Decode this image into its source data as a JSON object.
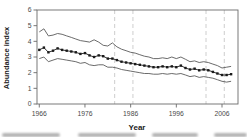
{
  "figure": {
    "xlabel": "Year",
    "ylabel": "Abundance index"
  },
  "chart_data": {
    "type": "line",
    "title": "",
    "xlabel": "Year",
    "ylabel": "Abundance index",
    "xlim": [
      1965.5,
      2009.5
    ],
    "ylim": [
      0,
      6
    ],
    "x_ticks": [
      1966,
      1976,
      1986,
      1996,
      2006
    ],
    "y_ticks": [
      0,
      1,
      2,
      3,
      4,
      5,
      6
    ],
    "grid": "off",
    "legend": "none",
    "reference_lines_x": [
      1982.5,
      1986.5,
      2002.5,
      2006.5
    ],
    "reference_line_color": "#c2c2c2",
    "axis_color": "#6a6a6a",
    "x": [
      1966,
      1967,
      1968,
      1969,
      1970,
      1971,
      1972,
      1973,
      1974,
      1975,
      1976,
      1977,
      1978,
      1979,
      1980,
      1981,
      1982,
      1983,
      1984,
      1985,
      1986,
      1987,
      1988,
      1989,
      1990,
      1991,
      1992,
      1993,
      1994,
      1995,
      1996,
      1997,
      1998,
      1999,
      2000,
      2001,
      2002,
      2003,
      2004,
      2005,
      2006,
      2007,
      2008
    ],
    "series": [
      {
        "name": "abundance-index",
        "style": "line-with-square-markers",
        "color": "#1a1a1a",
        "values": [
          3.45,
          3.6,
          3.3,
          3.4,
          3.55,
          3.45,
          3.4,
          3.35,
          3.3,
          3.2,
          3.25,
          3.1,
          3.0,
          3.1,
          3.05,
          2.9,
          2.9,
          2.8,
          2.7,
          2.65,
          2.6,
          2.55,
          2.5,
          2.45,
          2.4,
          2.35,
          2.35,
          2.4,
          2.35,
          2.4,
          2.35,
          2.45,
          2.3,
          2.2,
          2.25,
          2.15,
          2.2,
          2.15,
          2.05,
          1.95,
          1.85,
          1.85,
          1.9
        ]
      },
      {
        "name": "upper-confidence-limit",
        "style": "line",
        "color": "#5a5a5a",
        "values": [
          4.6,
          4.8,
          4.35,
          4.4,
          4.5,
          4.45,
          4.35,
          4.25,
          4.15,
          4.05,
          4.0,
          3.95,
          4.1,
          3.95,
          3.75,
          3.7,
          3.9,
          3.65,
          3.5,
          3.4,
          3.3,
          3.25,
          3.15,
          3.05,
          3.0,
          2.9,
          2.9,
          2.95,
          2.9,
          3.0,
          2.9,
          3.0,
          2.85,
          2.7,
          2.75,
          2.65,
          2.7,
          2.65,
          2.55,
          2.45,
          2.3,
          2.35,
          2.4
        ]
      },
      {
        "name": "lower-confidence-limit",
        "style": "line",
        "color": "#5a5a5a",
        "values": [
          2.9,
          3.0,
          2.7,
          2.8,
          2.9,
          2.85,
          2.8,
          2.75,
          2.7,
          2.6,
          2.65,
          2.5,
          2.45,
          2.5,
          2.5,
          2.35,
          2.35,
          2.3,
          2.2,
          2.15,
          2.1,
          2.05,
          2.0,
          1.95,
          1.95,
          1.9,
          1.9,
          1.95,
          1.9,
          1.95,
          1.9,
          1.95,
          1.85,
          1.75,
          1.8,
          1.7,
          1.75,
          1.7,
          1.65,
          1.55,
          1.45,
          1.4,
          1.45
        ]
      }
    ]
  }
}
